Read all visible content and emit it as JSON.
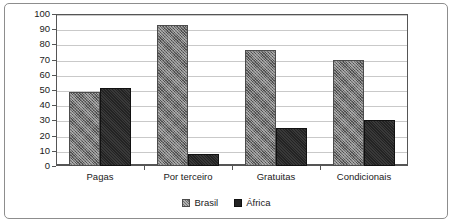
{
  "chart_data": {
    "type": "bar",
    "title": "",
    "subtitle": "",
    "xlabel": "",
    "ylabel": "",
    "categories": [
      "Pagas",
      "Por terceiro",
      "Gratuitas",
      "Condicionais"
    ],
    "series": [
      {
        "name": "Brasil",
        "values": [
          49,
          93,
          76,
          70
        ],
        "color": "#6f6f6f",
        "pattern": "checkered-hatch"
      },
      {
        "name": "África",
        "values": [
          51,
          8,
          25,
          30
        ],
        "color": "#232323",
        "pattern": "solid-dark"
      }
    ],
    "ylim": [
      0,
      100
    ],
    "yticks": [
      0,
      10,
      20,
      30,
      40,
      50,
      60,
      70,
      80,
      90,
      100
    ],
    "ytick_labels": [
      "0",
      "10",
      "20",
      "30",
      "40",
      "50",
      "60",
      "70",
      "80",
      "90",
      "100"
    ],
    "grid": true,
    "grid_axis": "y",
    "legend_position": "bottom-center",
    "legend_entries": [
      "Brasil",
      "África"
    ],
    "annotations": [],
    "frame": true,
    "border_color": "#8d8d8d",
    "axis_color": "#555555",
    "gridline_color": "#c9c9c9"
  }
}
